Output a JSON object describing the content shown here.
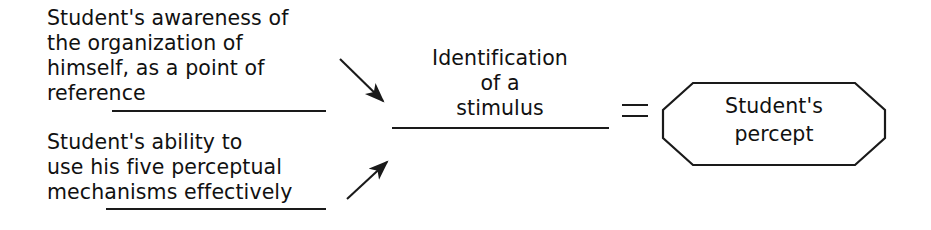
{
  "diagram": {
    "canvas": {
      "width": 931,
      "height": 230,
      "background": "#ffffff"
    },
    "ink_color": "#1a1a1a",
    "terms": {
      "awareness": "Student's awareness of\nthe organization of\nhimself, as a point of\nreference",
      "ability": "Student's ability to\nuse his five perceptual\nmechanisms effectively",
      "identification": "Identification\nof a\nstimulus",
      "percept": "Student's\npercept"
    },
    "operators": {
      "equals": "=",
      "arrow_top": "arrow-down-right",
      "arrow_bottom": "arrow-up-right"
    },
    "shapes": {
      "percept_container": "octagon"
    },
    "rules": [
      {
        "name": "awareness-underline"
      },
      {
        "name": "ability-underline"
      },
      {
        "name": "identification-underline"
      }
    ]
  }
}
